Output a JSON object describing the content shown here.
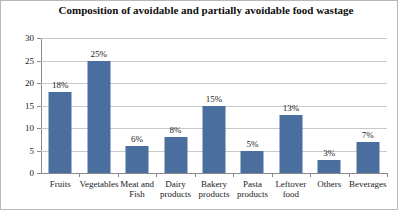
{
  "chart_data": {
    "type": "bar",
    "title": "Composition of avoidable and partially avoidable food wastage",
    "xlabel": "",
    "ylabel": "",
    "ylim": [
      0,
      30
    ],
    "ytick_labels": [
      "0",
      "5",
      "10",
      "15",
      "20",
      "25",
      "30"
    ],
    "ytick_values": [
      0,
      5,
      10,
      15,
      20,
      25,
      30
    ],
    "grid": true,
    "legend": false,
    "bar_color": "#4a6e9e",
    "categories": [
      "Fruits",
      "Vegetables",
      "Meat and Fish",
      "Dairy products",
      "Bakery products",
      "Pasta products",
      "Leftover food",
      "Others",
      "Beverages"
    ],
    "values": [
      18,
      25,
      6,
      8,
      15,
      5,
      13,
      3,
      7
    ],
    "data_labels": [
      "18%",
      "25%",
      "6%",
      "8%",
      "15%",
      "5%",
      "13%",
      "3%",
      "7%"
    ]
  }
}
